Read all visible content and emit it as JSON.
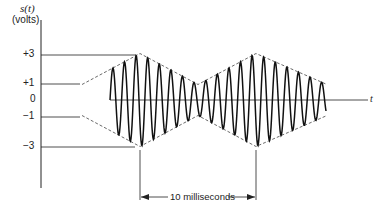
{
  "figure": {
    "y_label_line1": "s(t)",
    "y_label_line2": "(volts)",
    "x_label": "t",
    "ticks": [
      {
        "label": "+3",
        "value": 3
      },
      {
        "label": "+1",
        "value": 1
      },
      {
        "label": "0",
        "value": 0
      },
      {
        "label": "−1",
        "value": -1
      },
      {
        "label": "−3",
        "value": -3
      }
    ],
    "annotation": "10 milliseconds",
    "signal": "amplitude-modulated sinusoid",
    "envelope": "dashed triangular envelope oscillating between 1 and 3 volts"
  }
}
